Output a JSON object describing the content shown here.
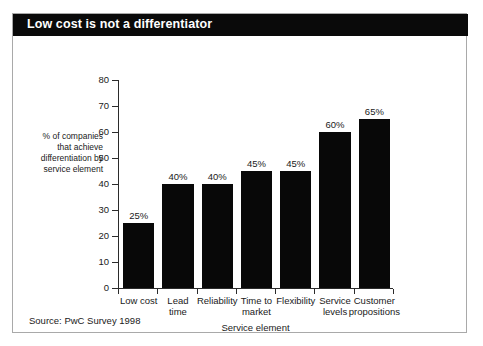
{
  "figure": {
    "title": "Low cost is not a differentiator",
    "source": "Source: PwC Survey 1998",
    "frame_color": "#a9a9a9",
    "title_bar_color": "#0a0a0a",
    "bar_color": "#080808",
    "background": "#ffffff"
  },
  "chart_data": {
    "type": "bar",
    "title": "Low cost is not a differentiator",
    "subtitle": "",
    "categories": [
      "Low cost",
      "Lead time",
      "Reliability",
      "Time to market",
      "Flexibility",
      "Service levels",
      "Customer propositions"
    ],
    "category_lines": [
      [
        "Low cost"
      ],
      [
        "Lead",
        "time"
      ],
      [
        "Reliability"
      ],
      [
        "Time to",
        "market"
      ],
      [
        "Flexibility"
      ],
      [
        "Service",
        "levels"
      ],
      [
        "Customer",
        "propositions"
      ]
    ],
    "values": [
      25,
      40,
      40,
      45,
      45,
      60,
      65
    ],
    "data_labels": [
      "25%",
      "40%",
      "40%",
      "45%",
      "45%",
      "60%",
      "65%"
    ],
    "xlabel": "Service element",
    "ylabel": "% of companies that achieve differentiation by service element",
    "ylabel_lines": [
      "% of companies",
      "that achieve",
      "differentiation by",
      "service element"
    ],
    "ylim": [
      0,
      80
    ],
    "ytick_values": [
      0,
      10,
      20,
      30,
      40,
      50,
      60,
      70,
      80
    ],
    "ytick_labels": [
      "0",
      "10",
      "20",
      "30",
      "40",
      "50",
      "60",
      "70",
      "80"
    ],
    "grid": false,
    "legend": false,
    "legend_position": "none",
    "series_name": "% of companies that achieve differentiation by service element"
  }
}
